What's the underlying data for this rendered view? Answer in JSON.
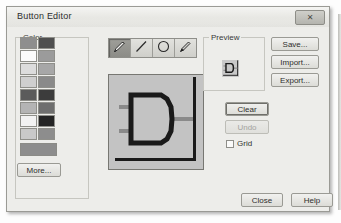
{
  "window": {
    "title": "Button Editor",
    "close_label": "✕",
    "close_icon": "close-icon"
  },
  "color_group": {
    "label": "Color",
    "swatches": [
      "#8e8e8e",
      "#4f4f4f",
      "#fbfbfb",
      "#9b9b9b",
      "#dcdcdc",
      "#a7a7a7",
      "#cfcfcf",
      "#8a8a8a",
      "#5b5b5b",
      "#3c3c3c",
      "#b4b4b4",
      "#6e6e6e",
      "#f2f2f2",
      "#242424",
      "#c9c9c9",
      "#8d8d8d"
    ],
    "selected_color": "#8d8d8d",
    "more_label": "More..."
  },
  "toolbar": {
    "tools": [
      {
        "name": "pencil-tool",
        "icon": "pencil-icon",
        "active": true
      },
      {
        "name": "line-tool",
        "icon": "line-icon",
        "active": false
      },
      {
        "name": "ellipse-tool",
        "icon": "ellipse-icon",
        "active": false
      },
      {
        "name": "fill-tool",
        "icon": "fill-pencil-icon",
        "active": false
      }
    ]
  },
  "canvas": {
    "name": "pixel-canvas",
    "drawing": "and-gate",
    "background": "#c3c3c3",
    "ink": "#1a1a1a",
    "wire": "#8a8a8a"
  },
  "preview": {
    "label": "Preview",
    "thumbnail": "and-gate"
  },
  "buttons": {
    "save": "Save...",
    "import": "Import...",
    "export": "Export...",
    "clear": "Clear",
    "undo": "Undo",
    "close": "Close",
    "help": "Help"
  },
  "grid_option": {
    "label": "Grid",
    "checked": false
  }
}
